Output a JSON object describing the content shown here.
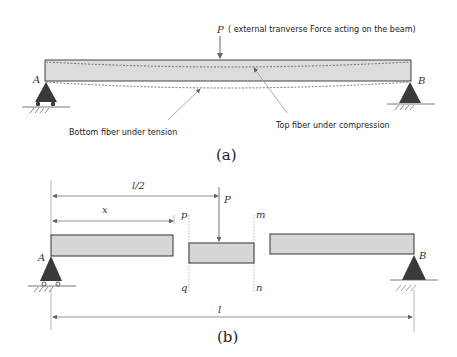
{
  "figure_a": {
    "force_symbol": "P",
    "force_description": "( external tranverse Force acting on the beam)",
    "support_left": "A",
    "support_right": "B",
    "annotation_bottom": "Bottom fiber under tension",
    "annotation_top": "Top fiber under compression",
    "caption": "(a)"
  },
  "figure_b": {
    "dim_half": "l/2",
    "dim_x": "x",
    "force_symbol": "P",
    "section_p": "p",
    "section_q": "q",
    "section_m": "m",
    "section_n": "n",
    "support_left": "A",
    "support_right": "B",
    "dim_total": "l",
    "caption": "(b)"
  },
  "colors": {
    "beam_fill": "#d6d6d6",
    "beam_stroke": "#333333",
    "support_fill": "#3a3a3a",
    "leader": "#8a8a8a"
  }
}
